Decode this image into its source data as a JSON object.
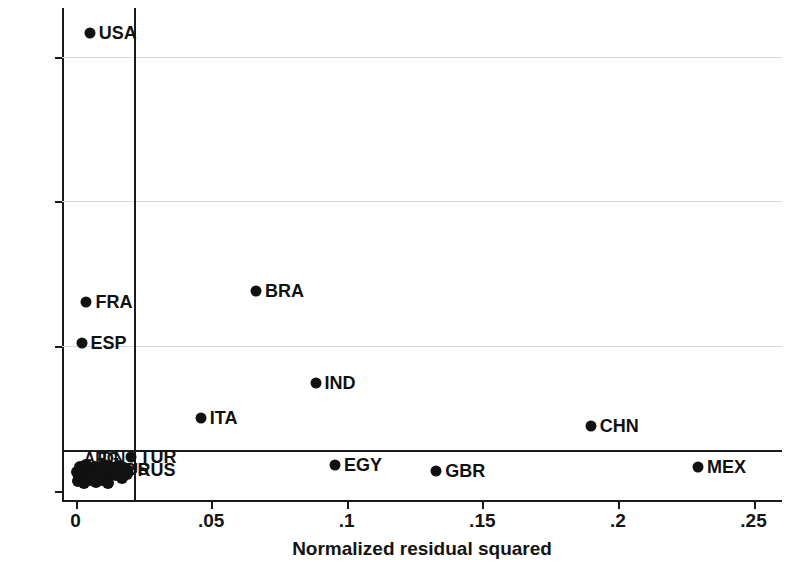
{
  "chart_data": {
    "type": "scatter",
    "title": "",
    "xlabel": "Normalized residual squared",
    "ylabel": "Leverage",
    "xlim": [
      -0.005,
      0.2605
    ],
    "ylim": [
      -0.012,
      0.667
    ],
    "xticks": [
      0,
      0.05,
      0.1,
      0.15,
      0.2,
      0.25
    ],
    "xtick_labels": [
      "0",
      ".05",
      ".1",
      ".15",
      ".2",
      ".25"
    ],
    "yticks": [
      0,
      0.2,
      0.4,
      0.6
    ],
    "ytick_labels": [
      "0",
      ".2",
      ".4",
      ".6"
    ],
    "grid": "horizontal-faint",
    "legend": "none",
    "reference_lines": {
      "vertical_x": 0.0215,
      "horizontal_y": 0.0565
    },
    "points": [
      {
        "label": "USA",
        "x": 0.0052,
        "y": 0.632
      },
      {
        "label": "FRA",
        "x": 0.004,
        "y": 0.261
      },
      {
        "label": "ESP",
        "x": 0.0022,
        "y": 0.205
      },
      {
        "label": "BRA",
        "x": 0.0665,
        "y": 0.276
      },
      {
        "label": "IND",
        "x": 0.0885,
        "y": 0.149
      },
      {
        "label": "ITA",
        "x": 0.0462,
        "y": 0.101
      },
      {
        "label": "CHN",
        "x": 0.19,
        "y": 0.09
      },
      {
        "label": "EGY",
        "x": 0.0957,
        "y": 0.036
      },
      {
        "label": "GBR",
        "x": 0.133,
        "y": 0.028
      },
      {
        "label": "MEX",
        "x": 0.2295,
        "y": 0.033
      },
      {
        "label": "TUR",
        "x": 0.0203,
        "y": 0.047
      },
      {
        "label": "RUS",
        "x": 0.0195,
        "y": 0.03
      }
    ],
    "cluster_points": [
      {
        "x": 0.0007,
        "y": 0.026
      },
      {
        "x": 0.0012,
        "y": 0.02
      },
      {
        "x": 0.0016,
        "y": 0.033
      },
      {
        "x": 0.0022,
        "y": 0.024
      },
      {
        "x": 0.0028,
        "y": 0.03
      },
      {
        "x": 0.0033,
        "y": 0.019
      },
      {
        "x": 0.0038,
        "y": 0.036
      },
      {
        "x": 0.0044,
        "y": 0.026
      },
      {
        "x": 0.0049,
        "y": 0.021
      },
      {
        "x": 0.0055,
        "y": 0.032
      },
      {
        "x": 0.0061,
        "y": 0.025
      },
      {
        "x": 0.0067,
        "y": 0.018
      },
      {
        "x": 0.0073,
        "y": 0.034
      },
      {
        "x": 0.0079,
        "y": 0.027
      },
      {
        "x": 0.0085,
        "y": 0.022
      },
      {
        "x": 0.0092,
        "y": 0.031
      },
      {
        "x": 0.0098,
        "y": 0.024
      },
      {
        "x": 0.0105,
        "y": 0.036
      },
      {
        "x": 0.0112,
        "y": 0.028
      },
      {
        "x": 0.0119,
        "y": 0.02
      },
      {
        "x": 0.0126,
        "y": 0.033
      },
      {
        "x": 0.0133,
        "y": 0.026
      },
      {
        "x": 0.0141,
        "y": 0.03
      },
      {
        "x": 0.0148,
        "y": 0.022
      },
      {
        "x": 0.0156,
        "y": 0.035
      },
      {
        "x": 0.0164,
        "y": 0.027
      },
      {
        "x": 0.0172,
        "y": 0.019
      },
      {
        "x": 0.018,
        "y": 0.032
      },
      {
        "x": 0.0189,
        "y": 0.024
      },
      {
        "x": 0.001,
        "y": 0.014
      },
      {
        "x": 0.003,
        "y": 0.012
      },
      {
        "x": 0.0052,
        "y": 0.015
      },
      {
        "x": 0.0075,
        "y": 0.013
      },
      {
        "x": 0.0098,
        "y": 0.016
      },
      {
        "x": 0.012,
        "y": 0.012
      }
    ],
    "cluster_labels": [
      {
        "text": "ARG",
        "x": 0.003,
        "y": 0.045
      },
      {
        "text": "IDN",
        "x": 0.0082,
        "y": 0.045
      },
      {
        "text": "CAN",
        "x": 0.0038,
        "y": 0.03
      },
      {
        "text": "KOR",
        "x": 0.009,
        "y": 0.03
      },
      {
        "text": "AUS",
        "x": 0.0145,
        "y": 0.03
      }
    ]
  }
}
